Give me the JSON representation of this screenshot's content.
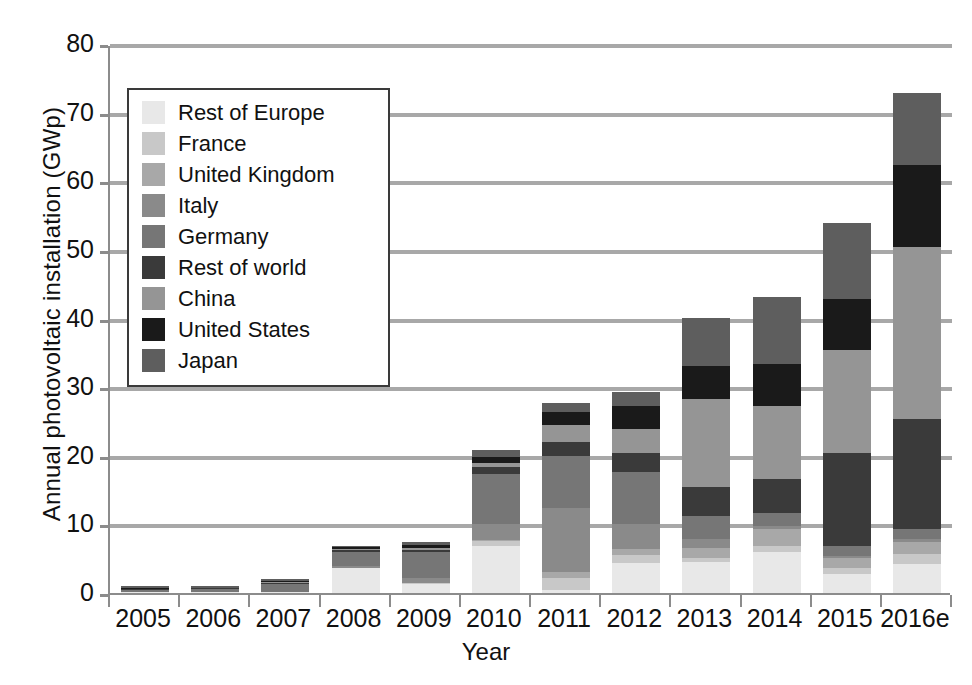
{
  "chart_data": {
    "type": "bar",
    "subtype": "stacked",
    "title": "",
    "xlabel": "Year",
    "ylabel": "Annual photovoltaic installation (GWp)",
    "ylim": [
      0,
      80
    ],
    "yticks": [
      0,
      10,
      20,
      30,
      40,
      50,
      60,
      70,
      80
    ],
    "ytick_labels": [
      "0",
      "10",
      "20",
      "30",
      "40",
      "50",
      "60",
      "70",
      "80"
    ],
    "grid": "horizontal",
    "legend_position": "upper-left-inside",
    "categories": [
      "2005",
      "2006",
      "2007",
      "2008",
      "2009",
      "2010",
      "2011",
      "2012",
      "2013",
      "2014",
      "2015",
      "2016e"
    ],
    "series": [
      {
        "name": "Japan",
        "color": "#5e5e5e",
        "values": [
          0.3,
          0.3,
          0.2,
          0.2,
          0.5,
          1.0,
          1.3,
          2.0,
          7.0,
          9.7,
          11.0,
          10.5
        ]
      },
      {
        "name": "United States",
        "color": "#1a1a1a",
        "values": [
          0.1,
          0.1,
          0.2,
          0.3,
          0.5,
          0.9,
          1.9,
          3.4,
          4.8,
          6.2,
          7.5,
          12.0
        ]
      },
      {
        "name": "China",
        "color": "#959595",
        "values": [
          0.0,
          0.0,
          0.1,
          0.1,
          0.2,
          0.5,
          2.5,
          3.5,
          12.9,
          10.6,
          15.0,
          25.0
        ]
      },
      {
        "name": "Rest of world",
        "color": "#3a3a3a",
        "values": [
          0.1,
          0.1,
          0.2,
          0.3,
          0.3,
          1.0,
          2.1,
          2.8,
          4.2,
          5.0,
          13.5,
          16.0
        ]
      },
      {
        "name": "Germany",
        "color": "#767676",
        "values": [
          0.4,
          0.5,
          1.1,
          2.0,
          3.8,
          7.4,
          7.5,
          7.6,
          3.3,
          1.9,
          1.5,
          1.5
        ]
      },
      {
        "name": "Italy",
        "color": "#8a8a8a",
        "values": [
          0.0,
          0.0,
          0.1,
          0.3,
          0.7,
          2.3,
          9.3,
          3.6,
          1.4,
          0.4,
          0.3,
          0.4
        ]
      },
      {
        "name": "United Kingdom",
        "color": "#a8a8a8",
        "values": [
          0.0,
          0.0,
          0.0,
          0.0,
          0.0,
          0.1,
          0.9,
          0.9,
          1.4,
          2.4,
          1.5,
          1.8
        ]
      },
      {
        "name": "France",
        "color": "#c8c8c8",
        "values": [
          0.0,
          0.0,
          0.0,
          0.1,
          0.2,
          0.7,
          1.7,
          1.1,
          0.6,
          0.9,
          0.9,
          1.4
        ]
      },
      {
        "name": "Rest of Europe",
        "color": "#e8e8e8",
        "values": [
          0.1,
          0.1,
          0.1,
          3.6,
          1.3,
          6.9,
          0.5,
          4.4,
          4.5,
          6.0,
          2.7,
          4.3
        ]
      }
    ],
    "totals": [
      1.0,
      1.1,
      2.0,
      6.9,
      7.5,
      20.8,
      27.7,
      29.3,
      40.1,
      43.1,
      53.9,
      72.9
    ]
  },
  "legend": {
    "items": [
      {
        "label": "Rest of Europe",
        "color": "#e8e8e8"
      },
      {
        "label": "France",
        "color": "#c8c8c8"
      },
      {
        "label": "United Kingdom",
        "color": "#a8a8a8"
      },
      {
        "label": "Italy",
        "color": "#8a8a8a"
      },
      {
        "label": "Germany",
        "color": "#767676"
      },
      {
        "label": "Rest of world",
        "color": "#3a3a3a"
      },
      {
        "label": "China",
        "color": "#959595"
      },
      {
        "label": "United States",
        "color": "#1a1a1a"
      },
      {
        "label": "Japan",
        "color": "#5e5e5e"
      }
    ]
  },
  "axes": {
    "y_title": "Annual photovoltaic installation (GWp)",
    "x_title": "Year"
  },
  "colors": {
    "axis": "#8c8c8c",
    "grid": "#a8a8a8",
    "text": "#111111",
    "background": "#ffffff"
  }
}
